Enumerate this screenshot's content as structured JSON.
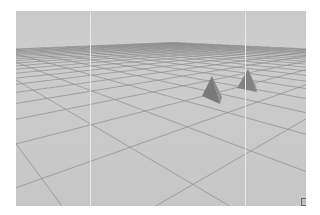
{
  "viewport": {
    "name": "3d-perspective-viewport",
    "background_color": "#c9c9c9",
    "grid_color": "#8a8a8a",
    "objects": [
      {
        "name": "cone-1",
        "color": "#7b7b7b"
      },
      {
        "name": "cone-2",
        "color": "#868686"
      }
    ],
    "labels": {
      "left": "",
      "right": ""
    }
  }
}
